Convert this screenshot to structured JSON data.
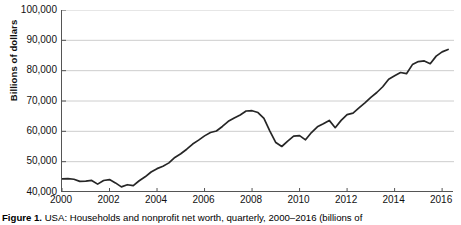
{
  "figure": {
    "caption_label": "Figure 1.",
    "caption_text": "USA: Households and nonprofit net worth, quarterly, 2000–2016 (billions of"
  },
  "chart_data": {
    "type": "line",
    "title": "",
    "xlabel": "",
    "ylabel": "Billions of dollars",
    "xlim": [
      2000,
      2016.5
    ],
    "ylim": [
      40000,
      100000
    ],
    "grid": true,
    "legend": "none",
    "line_color": "#262626",
    "gridline_color": "#c8c8c8",
    "axis_color": "#555555",
    "xticks": [
      "2000",
      "2002",
      "2004",
      "2006",
      "2008",
      "2010",
      "2012",
      "2014",
      "2016"
    ],
    "xtick_values": [
      2000,
      2002,
      2004,
      2006,
      2008,
      2010,
      2012,
      2014,
      2016
    ],
    "yticks": [
      "40,000",
      "50,000",
      "60,000",
      "70,000",
      "80,000",
      "90,000",
      "100,000"
    ],
    "ytick_values": [
      40000,
      50000,
      60000,
      70000,
      80000,
      90000,
      100000
    ],
    "series": [
      {
        "name": "Households and nonprofit net worth",
        "x": [
          2000.0,
          2000.25,
          2000.5,
          2000.75,
          2001.0,
          2001.25,
          2001.5,
          2001.75,
          2002.0,
          2002.25,
          2002.5,
          2002.75,
          2003.0,
          2003.25,
          2003.5,
          2003.75,
          2004.0,
          2004.25,
          2004.5,
          2004.75,
          2005.0,
          2005.25,
          2005.5,
          2005.75,
          2006.0,
          2006.25,
          2006.5,
          2006.75,
          2007.0,
          2007.25,
          2007.5,
          2007.75,
          2008.0,
          2008.25,
          2008.5,
          2008.75,
          2009.0,
          2009.25,
          2009.5,
          2009.75,
          2010.0,
          2010.25,
          2010.5,
          2010.75,
          2011.0,
          2011.25,
          2011.5,
          2011.75,
          2012.0,
          2012.25,
          2012.5,
          2012.75,
          2013.0,
          2013.25,
          2013.5,
          2013.75,
          2014.0,
          2014.25,
          2014.5,
          2014.75,
          2015.0,
          2015.25,
          2015.5,
          2015.75,
          2016.0,
          2016.25
        ],
        "values": [
          44300,
          44400,
          44200,
          43500,
          43600,
          43800,
          42600,
          43800,
          44100,
          43000,
          41700,
          42400,
          42100,
          43700,
          45000,
          46600,
          47700,
          48500,
          49600,
          51400,
          52600,
          54100,
          55800,
          57100,
          58500,
          59600,
          60100,
          61600,
          63300,
          64400,
          65400,
          66700,
          66800,
          66200,
          64300,
          60100,
          56300,
          55000,
          56800,
          58400,
          58600,
          57200,
          59600,
          61500,
          62500,
          63600,
          61200,
          63600,
          65500,
          66000,
          67700,
          69400,
          71200,
          72800,
          74700,
          77200,
          78300,
          79400,
          79000,
          82000,
          83000,
          83200,
          82300,
          84800,
          86200,
          87000
        ]
      }
    ]
  }
}
